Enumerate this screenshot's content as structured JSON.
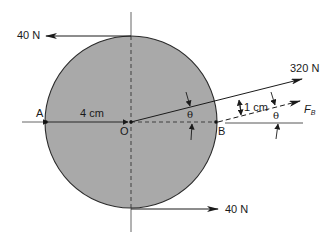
{
  "diagram": {
    "title": "",
    "colors": {
      "disk_fill": "#a9a9a9",
      "stroke": "#2a2a2a",
      "background": "#ffffff"
    },
    "forces": {
      "top": {
        "label": "40 N",
        "direction": "left"
      },
      "bottom": {
        "label": "40 N",
        "direction": "right"
      },
      "main": {
        "label": "320 N"
      },
      "fb": {
        "label": "F",
        "subscript": "B"
      }
    },
    "points": {
      "a": "A",
      "o": "O",
      "b": "B"
    },
    "dimensions": {
      "radius": "4 cm",
      "offset": "1 cm"
    },
    "angles": {
      "theta_center": "θ",
      "theta_right": "θ"
    }
  }
}
